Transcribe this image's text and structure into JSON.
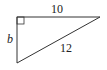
{
  "diagram": {
    "type": "right-triangle",
    "vertices": {
      "right_angle": [
        17,
        17
      ],
      "top_right": [
        100,
        17
      ],
      "bottom": [
        17,
        63
      ]
    },
    "labels": {
      "top_side": "10",
      "left_side": "b",
      "hypotenuse": "12"
    },
    "right_angle_marker": true,
    "stroke_color": "#333333"
  }
}
